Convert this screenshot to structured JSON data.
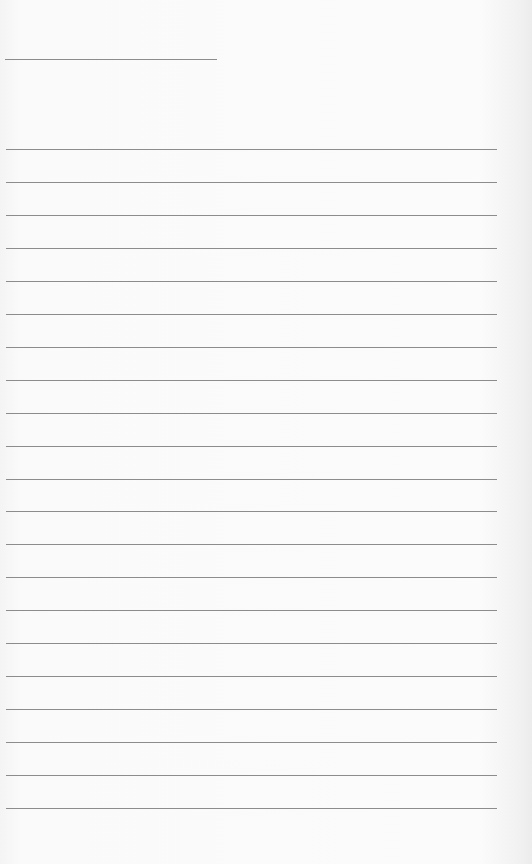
{
  "page": {
    "type": "lined-paper",
    "background_color": "#fafafa",
    "line_color": "#8c8c8c",
    "name_line": {
      "left": 5,
      "top": 59,
      "width": 212
    },
    "ruled_lines": {
      "count": 21,
      "first_top": 149,
      "spacing": 32.95,
      "left": 6,
      "width": 491
    }
  }
}
